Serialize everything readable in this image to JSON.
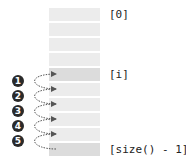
{
  "diagram": {
    "rows": [
      {
        "index": 0,
        "highlight": false
      },
      {
        "index": 1,
        "highlight": false
      },
      {
        "index": 2,
        "highlight": false
      },
      {
        "index": 3,
        "highlight": false
      },
      {
        "index": 4,
        "highlight": true
      },
      {
        "index": 5,
        "highlight": false
      },
      {
        "index": 6,
        "highlight": false
      },
      {
        "index": 7,
        "highlight": false
      },
      {
        "index": 8,
        "highlight": false
      },
      {
        "index": 9,
        "highlight": true
      }
    ],
    "labels": {
      "first": "[0]",
      "current": "[i]",
      "last": "[size() - 1]"
    },
    "steps": [
      "1",
      "2",
      "3",
      "4",
      "5"
    ],
    "colors": {
      "row": "#ececec",
      "row_highlight": "#dcdcdc",
      "badge": "#2a2a2a",
      "arrow": "#555555"
    }
  }
}
